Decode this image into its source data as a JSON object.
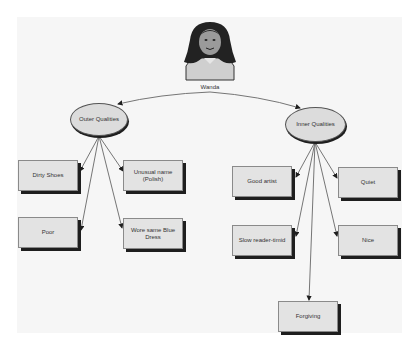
{
  "diagram": {
    "type": "concept-map",
    "root": {
      "label": "Wanda",
      "icon": "girl-portrait-icon"
    },
    "branches": [
      {
        "label": "Outer Qualities",
        "items": [
          "Dirty Shoes",
          "Unusual name (Polish)",
          "Poor",
          "Wore same Blue Dress"
        ]
      },
      {
        "label": "Inner Qualities",
        "items": [
          "Good artist",
          "Quiet",
          "Slow reader-timid",
          "Nice",
          "Forgiving"
        ]
      }
    ]
  },
  "colors": {
    "box_fill": "#e3e3e3",
    "shadow": "#1e1e1e",
    "line": "#555555",
    "panel": "#f6f6f6"
  }
}
